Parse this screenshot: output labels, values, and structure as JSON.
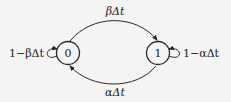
{
  "diagram": {
    "type": "markov-chain",
    "nodes": [
      {
        "id": "0",
        "label": "0",
        "cx": 68,
        "cy": 53,
        "r": 11.5
      },
      {
        "id": "1",
        "label": "1",
        "cx": 158,
        "cy": 53,
        "r": 11.5
      }
    ],
    "edges": [
      {
        "from": "0",
        "to": "1",
        "label": "βΔt"
      },
      {
        "from": "1",
        "to": "0",
        "label": "αΔt"
      },
      {
        "from": "0",
        "to": "0",
        "label": "1−βΔt"
      },
      {
        "from": "1",
        "to": "1",
        "label": "1−αΔt"
      }
    ],
    "colors": {
      "stroke": "#2a2a2a",
      "background": "#f4f4f2"
    }
  }
}
